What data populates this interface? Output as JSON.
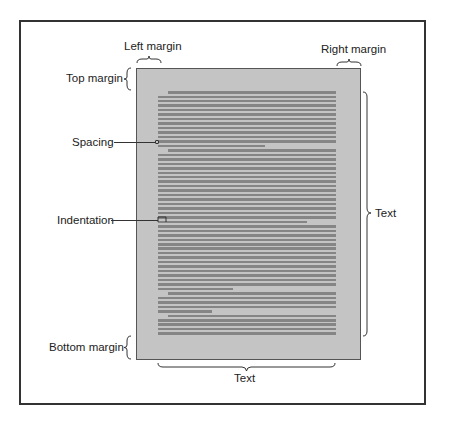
{
  "labels": {
    "left_margin": "Left margin",
    "right_margin": "Right margin",
    "top_margin": "Top margin",
    "spacing": "Spacing",
    "indentation": "Indentation",
    "bottom_margin": "Bottom margin",
    "text_right": "Text",
    "text_bottom": "Text"
  },
  "colors": {
    "page": "#c4c4c4",
    "text_line": "#858585",
    "frame": "#333333"
  },
  "page_lines": {
    "start_y": 91,
    "pitch": 4.47,
    "count": 55,
    "left_x": 158,
    "right_x": 336,
    "indent_x": 168,
    "indented": [
      0,
      13,
      45,
      50
    ],
    "short": {
      "12": 265,
      "29": 307,
      "44": 233,
      "49": 212
    }
  }
}
